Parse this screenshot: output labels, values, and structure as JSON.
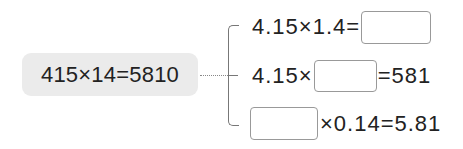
{
  "source_equation": "415×14=5810",
  "derived": [
    {
      "before": "4.15×1.4=",
      "after": ""
    },
    {
      "before": "4.15×",
      "after": "=581"
    },
    {
      "before": "",
      "after": "×0.14=5.81"
    }
  ],
  "colors": {
    "box_fill": "#ebebeb",
    "line": "#777777",
    "text": "#222222",
    "answer_border": "#999999"
  }
}
